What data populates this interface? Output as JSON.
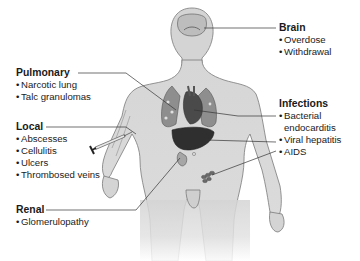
{
  "diagram": {
    "colors": {
      "body_fill": "#d9d9d9",
      "body_stroke": "#7a7a7a",
      "organ_dark": "#3a3a3a",
      "organ_mid": "#8c8c8c",
      "leader_line": "#333333",
      "text": "#1a1a1a"
    },
    "labels": {
      "brain": {
        "title": "Brain",
        "items": [
          "Overdose",
          "Withdrawal"
        ]
      },
      "pulmonary": {
        "title": "Pulmonary",
        "items": [
          "Narcotic lung",
          "Talc granulomas"
        ]
      },
      "local": {
        "title": "Local",
        "items": [
          "Abscesses",
          "Cellulitis",
          "Ulcers",
          "Thrombosed veins"
        ]
      },
      "infections": {
        "title": "Infections",
        "items": [
          "Bacterial",
          "endocarditis",
          "Viral hepatitis",
          "AIDS"
        ]
      },
      "renal": {
        "title": "Renal",
        "items": [
          "Glomerulopathy"
        ]
      }
    },
    "bullet": "•"
  }
}
